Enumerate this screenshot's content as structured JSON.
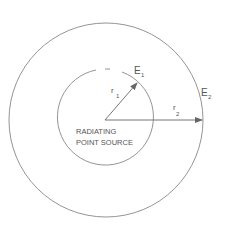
{
  "diagram": {
    "labels": {
      "e1": "E",
      "e1_sub": "1",
      "e2": "E",
      "e2_sub": "2",
      "r1": "r",
      "r1_sub": "1",
      "r2": "r",
      "r2_sub": "2",
      "source_line1": "RADIATING",
      "source_line2": "POINT SOURCE"
    },
    "colors": {
      "stroke": "#777777",
      "text": "#555555",
      "background": "#ffffff"
    }
  }
}
